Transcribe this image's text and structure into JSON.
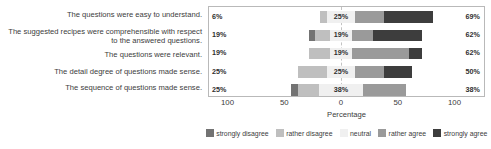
{
  "chart_data": {
    "type": "bar",
    "subtype": "diverging-stacked-likert",
    "title": "",
    "xlabel": "Percentage",
    "ylabel": "",
    "xlim": [
      -100,
      100
    ],
    "xticks": [
      100,
      50,
      0,
      50,
      100
    ],
    "grid": false,
    "legend_position": "bottom",
    "categories": [
      "The questions were easy to understand.",
      "The suggested recipes were comprehensible with respect to the answered questions.",
      "The questions were relevant.",
      "The detail degree of questions made sense.",
      "The sequence of questions made sense."
    ],
    "series": [
      {
        "name": "strongly disagree",
        "color": "#737373",
        "values": [
          0,
          6,
          0,
          0,
          6
        ]
      },
      {
        "name": "rather disagree",
        "color": "#bfbfbf",
        "values": [
          6,
          13,
          19,
          25,
          19
        ]
      },
      {
        "name": "neutral",
        "color": "#f0f0f0",
        "values": [
          25,
          19,
          19,
          25,
          38
        ]
      },
      {
        "name": "rather agree",
        "color": "#9a9a9a",
        "values": [
          25,
          19,
          50,
          25,
          38
        ]
      },
      {
        "name": "strongly agree",
        "color": "#3d3d3d",
        "values": [
          44,
          43,
          12,
          25,
          0
        ]
      }
    ],
    "left_totals": [
      "6%",
      "19%",
      "19%",
      "25%",
      "25%"
    ],
    "neutral_labels": [
      "25%",
      "19%",
      "19%",
      "25%",
      "38%"
    ],
    "right_totals": [
      "69%",
      "62%",
      "62%",
      "50%",
      "38%"
    ]
  },
  "axis": {
    "ticks": [
      {
        "label": "100",
        "pos": -100
      },
      {
        "label": "50",
        "pos": -50
      },
      {
        "label": "0",
        "pos": 0
      },
      {
        "label": "50",
        "pos": 50
      },
      {
        "label": "100",
        "pos": 100
      }
    ],
    "title": "Percentage"
  },
  "legend": {
    "items": [
      {
        "label": "strongly disagree",
        "color": "#737373"
      },
      {
        "label": "rather disagree",
        "color": "#bfbfbf"
      },
      {
        "label": "neutral",
        "color": "#f0f0f0"
      },
      {
        "label": "rather agree",
        "color": "#9a9a9a"
      },
      {
        "label": "strongly agree",
        "color": "#3d3d3d"
      }
    ]
  }
}
